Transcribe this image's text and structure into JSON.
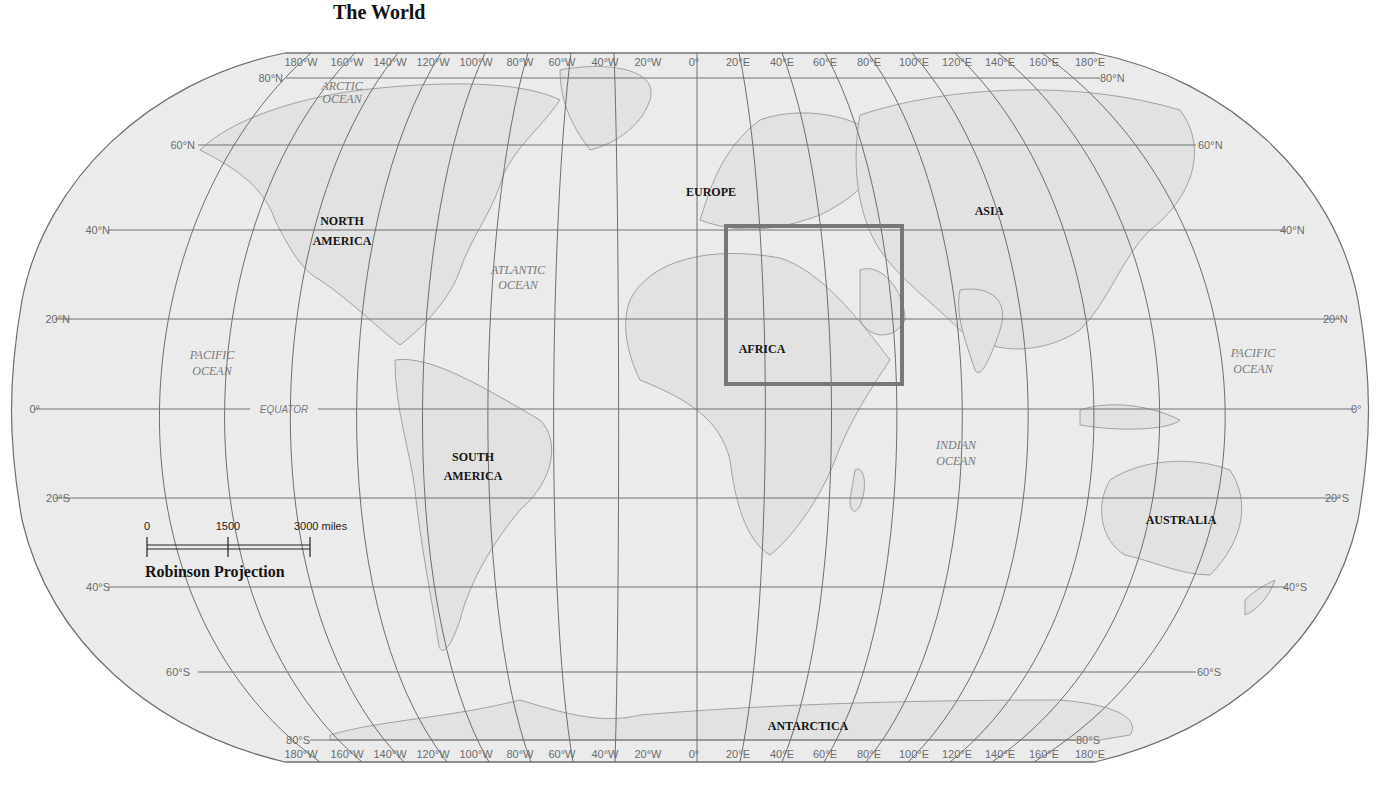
{
  "title": "The World",
  "map": {
    "projection": "Robinson Projection",
    "background_color": "#ebebeb",
    "graticule_color": "#6e6e6e",
    "highlight_box_color": "#777777",
    "longitude_labels": [
      "180°W",
      "160°W",
      "140°W",
      "120°W",
      "100°W",
      "80°W",
      "60°W",
      "40°W",
      "20°W",
      "0°",
      "20°E",
      "40°E",
      "60°E",
      "80°E",
      "100°E",
      "120°E",
      "140°E",
      "160°E",
      "180°E"
    ],
    "latitude_labels": {
      "n80": "80°N",
      "n60": "60°N",
      "n40": "40°N",
      "n20": "20°N",
      "eq": "0°",
      "s20": "20°S",
      "s40": "40°S",
      "s60": "60°S",
      "s80": "80°S"
    },
    "equator_label": "EQUATOR",
    "continents": {
      "north_america": [
        "NORTH",
        "AMERICA"
      ],
      "south_america": [
        "SOUTH",
        "AMERICA"
      ],
      "europe": "EUROPE",
      "africa": "AFRICA",
      "asia": "ASIA",
      "australia": "AUSTRALIA",
      "antarctica": "ANTARCTICA"
    },
    "oceans": {
      "arctic": [
        "ARCTIC",
        "OCEAN"
      ],
      "atlantic": [
        "ATLANTIC",
        "OCEAN"
      ],
      "pacific_west": [
        "PACIFIC",
        "OCEAN"
      ],
      "pacific_east": [
        "PACIFIC",
        "OCEAN"
      ],
      "indian": [
        "INDIAN",
        "OCEAN"
      ]
    },
    "highlight_region": "North Africa & Middle East"
  },
  "scale_bar": {
    "labels": [
      "0",
      "1500",
      "3000 miles"
    ]
  }
}
